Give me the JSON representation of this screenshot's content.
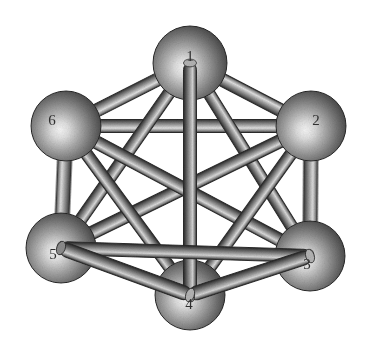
{
  "figure": {
    "background_color": "#ffffff",
    "width": 379,
    "height": 353,
    "style": "grayscale-shaded-3d",
    "graph_type": "complete-graph",
    "vertex_count": 6,
    "edge_count": 15
  },
  "palette": {
    "background": "#ffffff",
    "sphere_highlight": "#f2f2f2",
    "sphere_mid": "#9a9a9a",
    "sphere_dark": "#3c3c3c",
    "sphere_rim": "#242424",
    "rod_highlight": "#e6e6e6",
    "rod_mid": "#9d9d9d",
    "rod_dark": "#4a4a4a",
    "rod_edge": "#2b2b2b",
    "label_color": "#2f2f2f"
  },
  "nodes": [
    {
      "id": "1",
      "label": "1",
      "cx": 190,
      "cy": 63,
      "r": 37,
      "label_x": 190,
      "label_y": 58
    },
    {
      "id": "2",
      "label": "2",
      "cx": 311,
      "cy": 126,
      "r": 35,
      "label_x": 316,
      "label_y": 122
    },
    {
      "id": "3",
      "label": "3",
      "cx": 310,
      "cy": 256,
      "r": 35,
      "label_x": 307,
      "label_y": 266
    },
    {
      "id": "4",
      "label": "4",
      "cx": 190,
      "cy": 295,
      "r": 35,
      "label_x": 189,
      "label_y": 306
    },
    {
      "id": "5",
      "label": "5",
      "cx": 61,
      "cy": 248,
      "r": 35,
      "label_x": 53,
      "label_y": 256
    },
    {
      "id": "6",
      "label": "6",
      "cx": 66,
      "cy": 126,
      "r": 35,
      "label_x": 52,
      "label_y": 122
    }
  ],
  "edges": [
    {
      "id": "e-1-2",
      "from": "1",
      "to": "2",
      "width": 13,
      "layer": "back"
    },
    {
      "id": "e-1-6",
      "from": "1",
      "to": "6",
      "width": 13,
      "layer": "back"
    },
    {
      "id": "e-2-6",
      "from": "2",
      "to": "6",
      "width": 13,
      "layer": "back"
    },
    {
      "id": "e-2-3",
      "from": "2",
      "to": "3",
      "width": 14,
      "layer": "back"
    },
    {
      "id": "e-5-6",
      "from": "5",
      "to": "6",
      "width": 14,
      "layer": "back"
    },
    {
      "id": "e-1-5",
      "from": "1",
      "to": "5",
      "width": 12,
      "layer": "mid"
    },
    {
      "id": "e-1-3",
      "from": "1",
      "to": "3",
      "width": 12,
      "layer": "mid"
    },
    {
      "id": "e-2-5",
      "from": "2",
      "to": "5",
      "width": 13,
      "layer": "mid"
    },
    {
      "id": "e-3-6",
      "from": "3",
      "to": "6",
      "width": 13,
      "layer": "mid"
    },
    {
      "id": "e-2-4",
      "from": "2",
      "to": "4",
      "width": 12,
      "layer": "mid"
    },
    {
      "id": "e-4-6",
      "from": "4",
      "to": "6",
      "width": 12,
      "layer": "mid"
    },
    {
      "id": "e-1-4",
      "from": "1",
      "to": "4",
      "width": 13,
      "layer": "front"
    },
    {
      "id": "e-3-5",
      "from": "3",
      "to": "5",
      "width": 13,
      "layer": "front"
    },
    {
      "id": "e-3-4",
      "from": "3",
      "to": "4",
      "width": 14,
      "layer": "front"
    },
    {
      "id": "e-4-5",
      "from": "4",
      "to": "5",
      "width": 14,
      "layer": "front"
    }
  ]
}
